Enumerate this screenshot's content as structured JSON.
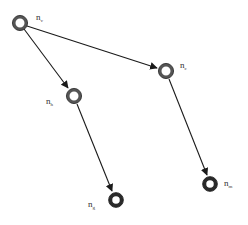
{
  "diagram": {
    "colors": {
      "edge": "#1a1a1a",
      "node_ring": "#555555",
      "node_ring_dark": "#2a2a2a",
      "node_inner": "#ffffff",
      "label": "#333333"
    },
    "nodes": [
      {
        "id": "v",
        "label": "n",
        "subscript": "v",
        "x": 20,
        "y": 23,
        "lx": 36,
        "ly": 20
      },
      {
        "id": "c",
        "label": "n",
        "subscript": "c",
        "x": 166,
        "y": 71,
        "lx": 180,
        "ly": 68
      },
      {
        "id": "h",
        "label": "n",
        "subscript": "h",
        "x": 74,
        "y": 96,
        "lx": 46,
        "ly": 104
      },
      {
        "id": "g",
        "label": "n",
        "subscript": "g",
        "x": 116,
        "y": 200,
        "lx": 88,
        "ly": 207
      },
      {
        "id": "m",
        "label": "n",
        "subscript": "m",
        "x": 210,
        "y": 184,
        "lx": 224,
        "ly": 186
      }
    ],
    "edges": [
      {
        "from": "v",
        "to": "c"
      },
      {
        "from": "v",
        "to": "h"
      },
      {
        "from": "h",
        "to": "g"
      },
      {
        "from": "c",
        "to": "m"
      }
    ]
  }
}
